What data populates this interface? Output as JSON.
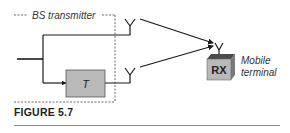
{
  "diagram": {
    "bs_label": "BS transmitter",
    "delay_block_label": "T",
    "rx_label": "RX",
    "mobile_label_line1": "Mobile",
    "mobile_label_line2": "terminal"
  },
  "caption": {
    "figure_label": "FIGURE 5.7"
  },
  "colors": {
    "line": "#1a1a1a",
    "box_fill": "#b9b9b9",
    "rx_top": "#4a4a4a",
    "dashed": "#444444",
    "text": "#333333"
  }
}
